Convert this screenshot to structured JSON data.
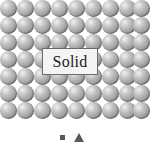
{
  "figure": {
    "name": "solid-state-particle-diagram",
    "label": "Solid",
    "background_color": "#ffffff"
  },
  "lattice": {
    "columns": 9,
    "rows": 7,
    "particle_diameter_px": 17,
    "row_pitch_px": 17,
    "arrangement": "close-packed-regular-grid",
    "particle_color": "#a8a8a8",
    "particle_highlight_color": "#f2f2f2",
    "particle_shadow_color": "#6e6e6e",
    "row_offsets_px": [
      0,
      17,
      34,
      51,
      68,
      85,
      102
    ],
    "col_offsets_px": [
      0,
      17,
      34,
      51,
      68,
      85,
      102,
      119,
      133
    ]
  },
  "label_box": {
    "text": "Solid",
    "fill_color": "#f4f4f4",
    "border_color": "#6b6b6b",
    "left_px": 42,
    "top_px": 48,
    "width_px": 56,
    "height_px": 27
  },
  "bottom_marks": {
    "items": [
      {
        "shape": "square",
        "color": "#5a5a5a",
        "left_px": 60
      },
      {
        "shape": "triangle",
        "color": "#5a5a5a",
        "left_px": 74
      }
    ],
    "note": "partially cropped at image bottom edge"
  }
}
